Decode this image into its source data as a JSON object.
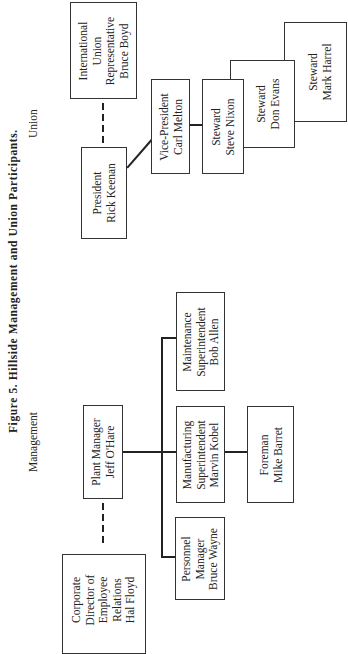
{
  "figure": {
    "title": "Figure 5. Hillside Management and Union Participants.",
    "sections": {
      "union": "Union",
      "management": "Management"
    }
  },
  "union": {
    "international_rep": {
      "lines": [
        "International",
        "Union",
        "Representative",
        "Bruce Boyd"
      ]
    },
    "president": {
      "lines": [
        "President",
        "Rick Keenan"
      ]
    },
    "vice_president": {
      "lines": [
        "Vice-President",
        "Carl Melton"
      ]
    },
    "stewards": [
      {
        "lines": [
          "Steward",
          "Steve Nixon"
        ]
      },
      {
        "lines": [
          "Steward",
          "Don Evans"
        ]
      },
      {
        "lines": [
          "Steward",
          "Mark Harrel"
        ]
      }
    ]
  },
  "management": {
    "corporate_director": {
      "lines": [
        "Corporate",
        "Director of",
        "Employee",
        "Relations",
        "Hal Floyd"
      ]
    },
    "plant_manager": {
      "lines": [
        "Plant Manager",
        "Jeff O'Hare"
      ]
    },
    "maintenance": {
      "lines": [
        "Maintenance",
        "Superintendent",
        "Bob Allen"
      ]
    },
    "manufacturing": {
      "lines": [
        "Manufacturing",
        "Superintendent",
        "Marvin Kobel"
      ]
    },
    "personnel": {
      "lines": [
        "Personnel",
        "Manager",
        "Bruce Wayne"
      ]
    },
    "foreman": {
      "lines": [
        "Foreman",
        "Mike Barret"
      ]
    }
  },
  "relationships": [
    {
      "from": "President Rick Keenan",
      "to": "International Union Representative Bruce Boyd",
      "style": "dashed"
    },
    {
      "from": "President Rick Keenan",
      "to": "Vice-President Carl Melton",
      "style": "solid"
    },
    {
      "from": "Vice-President Carl Melton",
      "to": "Steward Steve Nixon",
      "style": "solid"
    },
    {
      "from": "Plant Manager Jeff O'Hare",
      "to": "Corporate Director of Employee Relations Hal Floyd",
      "style": "dashed"
    },
    {
      "from": "Plant Manager Jeff O'Hare",
      "to": "Maintenance Superintendent Bob Allen",
      "style": "solid"
    },
    {
      "from": "Plant Manager Jeff O'Hare",
      "to": "Manufacturing Superintendent Marvin Kobel",
      "style": "solid"
    },
    {
      "from": "Plant Manager Jeff O'Hare",
      "to": "Personnel Manager Bruce Wayne",
      "style": "solid"
    },
    {
      "from": "Manufacturing Superintendent Marvin Kobel",
      "to": "Foreman Mike Barret",
      "style": "solid"
    }
  ]
}
